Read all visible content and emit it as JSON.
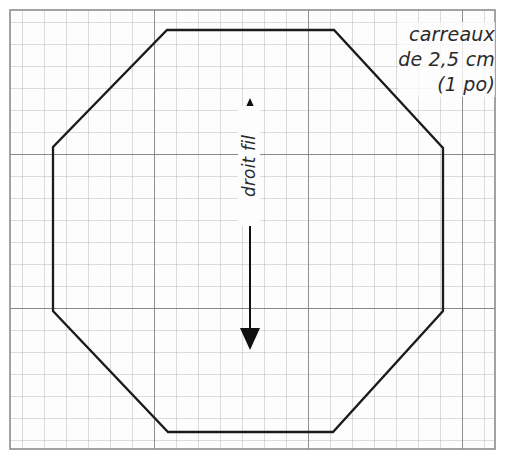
{
  "figure": {
    "kind": "sewing-pattern-piece",
    "title_visible": false,
    "colors": {
      "background": "#ffffff",
      "grid_minor": "#b9b9bd",
      "grid_major": "#6e6e73",
      "grid_border": "#8d8d92",
      "shape_outline": "#1b1b1b",
      "arrow": "#111111",
      "text": "#2b2b2b"
    },
    "grid": {
      "columns": 22,
      "rows": 20,
      "cell_px": 22,
      "origin_x": 10,
      "origin_y": 10,
      "major_every": 7
    },
    "shape": {
      "name": "octagon",
      "sides": 8,
      "vertices": [
        [
          167,
          30
        ],
        [
          334,
          30
        ],
        [
          443,
          148
        ],
        [
          443,
          311
        ],
        [
          333,
          432
        ],
        [
          168,
          432
        ],
        [
          53,
          311
        ],
        [
          53,
          147
        ]
      ]
    },
    "grainline": {
      "label": "droit fil",
      "x": 250,
      "y_top": 100,
      "y_bottom": 348,
      "double_headed": true
    }
  },
  "annotations": {
    "scale_note": {
      "line1": "carreaux",
      "line2": "de 2,5 cm",
      "line3": "(1 po)"
    }
  }
}
